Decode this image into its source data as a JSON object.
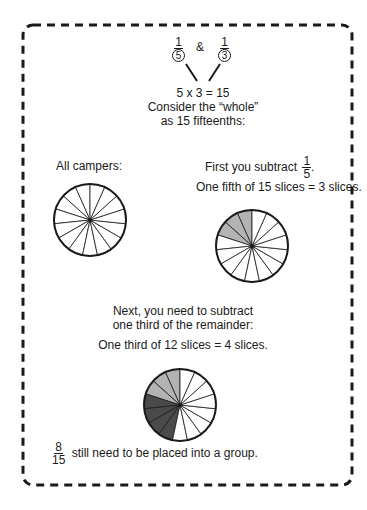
{
  "header": {
    "fraction_a": {
      "numerator": "1",
      "denominator": "5"
    },
    "ampersand": "&",
    "fraction_b": {
      "numerator": "1",
      "denominator": "3"
    },
    "equation": "5 x 3 = 15",
    "line1": "Consider the “whole”",
    "line2": "as 15 fifteenths:"
  },
  "left": {
    "label": "All campers:"
  },
  "right": {
    "label_prefix": "First you subtract",
    "fraction": {
      "numerator": "1",
      "denominator": "5"
    },
    "label_suffix": ".",
    "line2": "One fifth of 15 slices = 3 slices."
  },
  "middle": {
    "line1": "Next, you need to subtract",
    "line2": "one third of the remainder:",
    "line3": "One third of 12 slices = 4 slices."
  },
  "footer": {
    "fraction": {
      "numerator": "8",
      "denominator": "15"
    },
    "text": "still need to be placed into a group."
  },
  "pies": [
    {
      "name": "all-campers-pie",
      "slices": 15,
      "light": 0,
      "dark": 0
    },
    {
      "name": "subtract-fifth-pie",
      "slices": 15,
      "light": 3,
      "dark": 0
    },
    {
      "name": "subtract-third-pie",
      "slices": 15,
      "light": 3,
      "dark": 4
    }
  ],
  "colors": {
    "light": "#b3b3b3",
    "dark": "#4a4a4a",
    "stroke": "#1a1a1a"
  }
}
